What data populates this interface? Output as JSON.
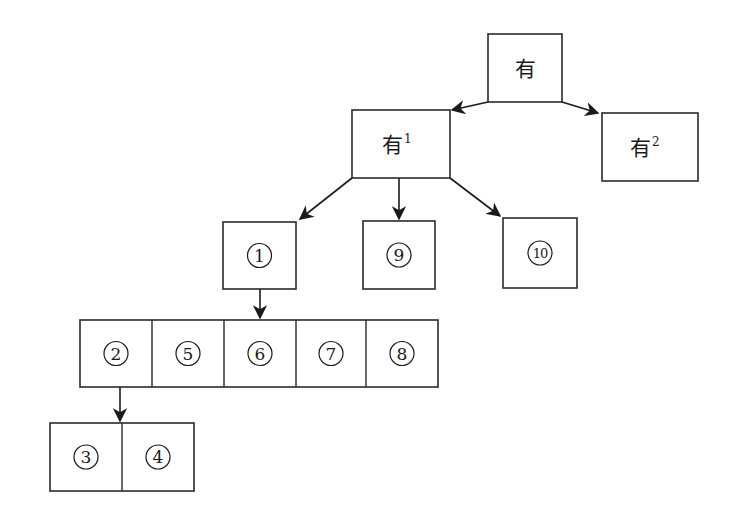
{
  "diagram": {
    "type": "tree",
    "root": {
      "id": "root",
      "char": "有",
      "sup": ""
    },
    "level1": [
      {
        "id": "you1",
        "char": "有",
        "sup": "1"
      },
      {
        "id": "you2",
        "char": "有",
        "sup": "2"
      }
    ],
    "level2": [
      {
        "id": "n1",
        "label": "1"
      },
      {
        "id": "n9",
        "label": "9"
      },
      {
        "id": "n10",
        "label": "10"
      }
    ],
    "level3_row": [
      {
        "id": "n2",
        "label": "2"
      },
      {
        "id": "n5",
        "label": "5"
      },
      {
        "id": "n6",
        "label": "6"
      },
      {
        "id": "n7",
        "label": "7"
      },
      {
        "id": "n8",
        "label": "8"
      }
    ],
    "level4_row": [
      {
        "id": "n3",
        "label": "3"
      },
      {
        "id": "n4",
        "label": "4"
      }
    ],
    "edges": [
      {
        "from": "root",
        "to": "you1"
      },
      {
        "from": "root",
        "to": "you2"
      },
      {
        "from": "you1",
        "to": "n1"
      },
      {
        "from": "you1",
        "to": "n9"
      },
      {
        "from": "you1",
        "to": "n10"
      },
      {
        "from": "n1",
        "to": "level3_row"
      },
      {
        "from": "n2",
        "to": "level4_row"
      }
    ]
  }
}
